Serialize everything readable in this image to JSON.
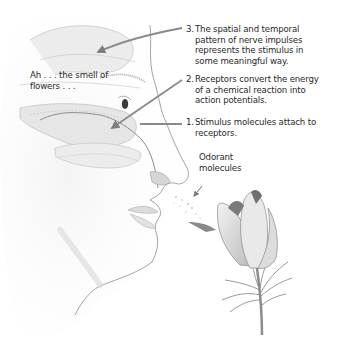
{
  "diagram": {
    "thought_label": "Ah . . . the smell of flowers . . .",
    "thought_lines": [
      "Ah . . . the smell of",
      "flowers . . ."
    ],
    "steps": [
      {
        "number": "3.",
        "lines": [
          "The spatial and temporal",
          "pattern of nerve impulses",
          "represents the stimulus in",
          "some meaningful way."
        ]
      },
      {
        "number": "2.",
        "lines": [
          "Receptors convert the energy",
          "of a chemical reaction into",
          "action potentials."
        ]
      },
      {
        "number": "1.",
        "lines": [
          "Stimulus molecules attach to",
          "receptors."
        ]
      }
    ],
    "odorant_lines": [
      "Odorant",
      "molecules"
    ],
    "colors": {
      "background": "#ffffff",
      "text": "#2a2a2a",
      "arrow": "#8a8a8a",
      "sketch": "#9a9a9a",
      "shade": "#d8d8d8"
    }
  }
}
